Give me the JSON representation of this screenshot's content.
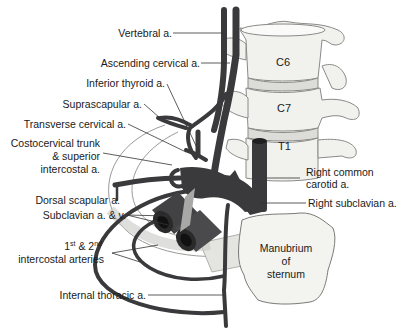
{
  "diagram": {
    "colors": {
      "vessel": "#3a3a3c",
      "vessel_highlight": "#5a5a5c",
      "bone_fill": "#f1f1ee",
      "bone_stroke": "#8a8a88",
      "rib_fill": "#e6e6e2",
      "leader_line": "#333333"
    },
    "vertebrae": [
      {
        "id": "c6",
        "label": "C6"
      },
      {
        "id": "c7",
        "label": "C7"
      },
      {
        "id": "t1",
        "label": "T1"
      }
    ],
    "sternum": {
      "line1": "Manubrium",
      "line2": "of",
      "line3": "sternum"
    },
    "left_labels": {
      "vertebral": "Vertebral a.",
      "ascending_cervical": "Ascending cervical a.",
      "inferior_thyroid": "Inferior thyroid a.",
      "suprascapular": "Suprascapular a.",
      "transverse_cervical": "Transverse cervical a.",
      "costocervical_1": "Costocervical trunk",
      "costocervical_2": "& superior",
      "costocervical_3": "intercostal a.",
      "dorsal_scapular": "Dorsal scapular a.",
      "subclavian_av": "Subclavian a. & v.",
      "intercostal_1a": "1",
      "intercostal_1b": "st",
      "intercostal_1c": " & 2",
      "intercostal_1d": "nd",
      "intercostal_2": "intercostal arteries",
      "internal_thoracic": "Internal thoracic a."
    },
    "right_labels": {
      "right_common_carotid_1": "Right common",
      "right_common_carotid_2": "carotid a.",
      "right_subclavian": "Right subclavian a."
    }
  }
}
